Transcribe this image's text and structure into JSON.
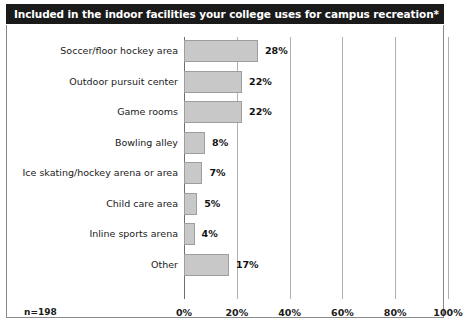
{
  "title": "Included in the indoor facilities your college uses for campus recreation*",
  "sample_note": "n=198",
  "colors": {
    "title_bar_background": "#1a1a1a",
    "title_text": "#ffffff",
    "bar_fill": "#c8c8c8",
    "bar_border": "#9e9e9e",
    "gridline": "#b0b0b0",
    "axis": "#6e6e6e",
    "frame_border": "#8a8a8a",
    "text": "#1a1a1a",
    "page_background": "#ffffff"
  },
  "chart_data": {
    "type": "bar",
    "orientation": "horizontal",
    "title": "Included in the indoor facilities your college uses for campus recreation*",
    "xlabel": "",
    "ylabel": "",
    "xlim": [
      0,
      100
    ],
    "grid": true,
    "legend": false,
    "categories": [
      "Soccer/floor hockey area",
      "Outdoor pursuit center",
      "Game rooms",
      "Bowling alley",
      "Ice skating/hockey arena or area",
      "Child care area",
      "Inline sports arena",
      "Other"
    ],
    "values": [
      28,
      22,
      22,
      8,
      7,
      5,
      4,
      17
    ],
    "value_labels": [
      "28%",
      "22%",
      "22%",
      "8%",
      "7%",
      "5%",
      "4%",
      "17%"
    ],
    "xticks": [
      0,
      20,
      40,
      60,
      80,
      100
    ],
    "xtick_labels": [
      "0%",
      "20%",
      "40%",
      "60%",
      "80%",
      "100%"
    ],
    "annotations": [
      "n=198"
    ]
  }
}
